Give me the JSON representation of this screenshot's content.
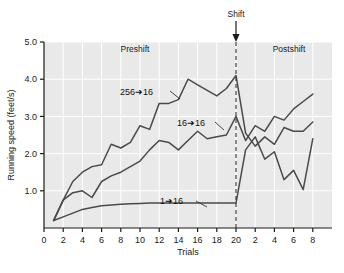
{
  "chart_data": {
    "type": "line",
    "title": "",
    "xlabel": "Trials",
    "ylabel": "Running speed (feet/s)",
    "xlim": [
      0,
      30
    ],
    "ylim": [
      0,
      5.0
    ],
    "grid": true,
    "legend_position": "inline-annotations",
    "y_ticks": [
      "1.0",
      "2.0",
      "3.0",
      "4.0",
      "5.0"
    ],
    "y_tick_values": [
      1.0,
      2.0,
      3.0,
      4.0,
      5.0
    ],
    "x_ticks": [
      "0",
      "2",
      "4",
      "6",
      "8",
      "10",
      "12",
      "14",
      "16",
      "18",
      "20",
      "2",
      "4",
      "6",
      "8"
    ],
    "x_tick_values": [
      0,
      2,
      4,
      6,
      8,
      10,
      12,
      14,
      16,
      18,
      20,
      22,
      24,
      26,
      28
    ],
    "shift_trial": 20,
    "annotations": [
      {
        "name": "shift-marker",
        "text": "Shift",
        "x": 20
      },
      {
        "name": "preshift-region",
        "text": "Preshift"
      },
      {
        "name": "postshift-region",
        "text": "Postshift"
      }
    ],
    "x": [
      1,
      2,
      3,
      4,
      5,
      6,
      7,
      8,
      9,
      10,
      11,
      12,
      13,
      14,
      15,
      16,
      17,
      18,
      19,
      20,
      21,
      22,
      23,
      24,
      25,
      26,
      27,
      28
    ],
    "series": [
      {
        "name": "256 to 16",
        "label": "256➜16",
        "color": "#4a4a4a",
        "values": [
          0.2,
          0.75,
          1.25,
          1.5,
          1.65,
          1.7,
          2.25,
          2.15,
          2.3,
          2.75,
          2.65,
          3.35,
          3.35,
          3.45,
          4.0,
          3.85,
          3.7,
          3.55,
          3.75,
          4.1,
          2.55,
          2.2,
          2.45,
          2.25,
          2.7,
          2.6,
          2.6,
          2.85
        ]
      },
      {
        "name": "16 to 16",
        "label": "16➜16",
        "color": "#4a4a4a",
        "values": [
          0.2,
          0.75,
          0.95,
          1.0,
          0.82,
          1.25,
          1.4,
          1.5,
          1.65,
          1.8,
          2.1,
          2.35,
          2.3,
          2.1,
          2.35,
          2.6,
          2.4,
          2.45,
          2.5,
          3.0,
          2.35,
          2.75,
          2.6,
          3.0,
          2.9,
          3.2,
          3.4,
          3.6
        ]
      },
      {
        "name": "1 to 16",
        "label": "1➜16",
        "color": "#4a4a4a",
        "values": [
          0.2,
          0.3,
          0.4,
          0.5,
          0.55,
          0.6,
          0.62,
          0.64,
          0.65,
          0.66,
          0.67,
          0.67,
          0.67,
          0.67,
          0.67,
          0.67,
          0.67,
          0.67,
          0.67,
          0.67,
          2.1,
          2.45,
          1.85,
          2.05,
          1.3,
          1.55,
          1.03,
          2.4
        ]
      }
    ]
  }
}
